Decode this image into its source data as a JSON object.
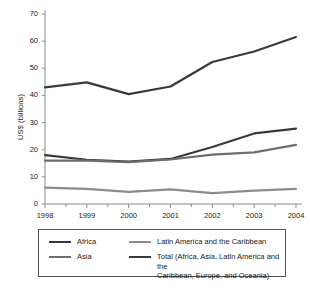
{
  "chart_data": {
    "type": "line",
    "title": "",
    "subtitle": "",
    "xlabel": "",
    "ylabel": "US$ (billions)",
    "categories": [
      "1998",
      "1999",
      "2000",
      "2001",
      "2002",
      "2003",
      "2004"
    ],
    "x": [
      1998,
      1999,
      2000,
      2001,
      2002,
      2003,
      2004
    ],
    "xlim": [
      1998,
      2004
    ],
    "ylim": [
      0,
      70
    ],
    "y_ticks": [
      0,
      10,
      20,
      30,
      40,
      50,
      60,
      70
    ],
    "y_tick_labels": [
      "0",
      "10",
      "20",
      "30",
      "40",
      "50",
      "60",
      "70"
    ],
    "grid": false,
    "legend_position": "bottom",
    "series": [
      {
        "name": "Africa",
        "color": "#3a3a3a",
        "width": 2.2,
        "values": [
          18.0,
          16.3,
          15.6,
          16.6,
          21.0,
          26.0,
          27.8
        ]
      },
      {
        "name": "Asia",
        "color": "#6e6e6e",
        "width": 2.2,
        "values": [
          16.0,
          16.0,
          15.4,
          16.4,
          18.2,
          19.0,
          21.8
        ]
      },
      {
        "name": "Latin America and the Caribbean",
        "color": "#8c8c8c",
        "width": 2.2,
        "values": [
          6.0,
          5.6,
          4.5,
          5.4,
          4.0,
          4.9,
          5.6
        ]
      },
      {
        "name": "Total (Africa, Asia, Latin America and the\nCaribbean, Europe, and Oceania)",
        "color": "#3a3a3a",
        "width": 2.2,
        "values": [
          43.0,
          44.8,
          40.5,
          43.3,
          52.3,
          56.2,
          61.5
        ]
      }
    ]
  },
  "legend": {
    "entries": [
      {
        "label": "Africa",
        "color": "#3a3a3a"
      },
      {
        "label": "Asia",
        "color": "#6e6e6e"
      },
      {
        "label": "Latin America and the Caribbean",
        "color": "#8c8c8c"
      },
      {
        "label": "Total (Africa, Asia, Latin America and the\nCaribbean, Europe, and Oceania)",
        "color": "#3a3a3a"
      }
    ]
  },
  "axes": {
    "y_title": "US$ (billions)",
    "axis_color": "#8a8a8a"
  }
}
